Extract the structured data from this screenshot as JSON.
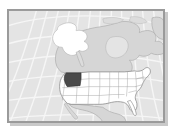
{
  "figure": {
    "title": "North America locator map",
    "caption": "",
    "width_px": 172,
    "height_px": 131
  },
  "frame": {
    "border_color": "#9a9a9a",
    "shadow_color": "#c9c9c9",
    "page_background": "#ffffff"
  },
  "map": {
    "projection_label": "conic",
    "ocean_color": "#e4e4e4",
    "graticule_color": "#f7f7f7",
    "land_color": "#d6d6d6",
    "land_outline_color": "#9b9b9b",
    "focus_country_fill": "#ffffff",
    "focus_country_outline": "#808080",
    "state_boundary_color": "#a8a8a8",
    "highlight_fill": "#4a4a4a",
    "highlight_outline": "#2e2e2e",
    "graticule_meridians": 13,
    "graticule_parallels": 7
  },
  "regions": [
    {
      "name": "Pacific Ocean",
      "kind": "water",
      "fill": "#e4e4e4"
    },
    {
      "name": "Atlantic Ocean",
      "kind": "water",
      "fill": "#e4e4e4"
    },
    {
      "name": "Canada",
      "kind": "land",
      "fill": "#d6d6d6"
    },
    {
      "name": "Greenland",
      "kind": "land",
      "fill": "#d6d6d6"
    },
    {
      "name": "Mexico",
      "kind": "land",
      "fill": "#d6d6d6"
    },
    {
      "name": "Alaska",
      "kind": "land",
      "fill": "#ffffff"
    },
    {
      "name": "Contiguous United States",
      "kind": "land",
      "fill": "#ffffff"
    },
    {
      "name": "Highlighted state",
      "kind": "highlight",
      "fill": "#4a4a4a"
    }
  ],
  "highlight": {
    "label": "highlighted-state",
    "fill": "#4a4a4a",
    "position": "western United States",
    "bbox_px": [
      72,
      69,
      15,
      13
    ]
  },
  "legend": {
    "visible": false,
    "entries": []
  },
  "labels": {
    "visible": false,
    "items": []
  }
}
